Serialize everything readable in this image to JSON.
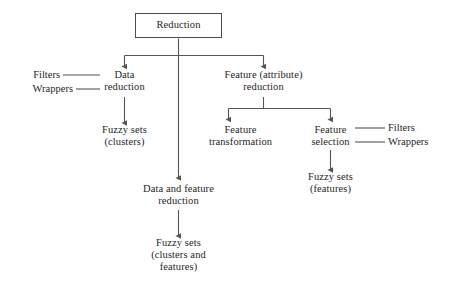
{
  "diagram": {
    "stroke_color": "#555555",
    "text_color": "#262626",
    "background": "#ffffff",
    "nodes": {
      "root": {
        "label": "Reduction"
      },
      "data_reduction": {
        "line1": "Data",
        "line2": "reduction"
      },
      "feature_reduction": {
        "line1": "Feature (attribute)",
        "line2": "reduction"
      },
      "fuzzy_clusters": {
        "line1": "Fuzzy sets",
        "line2": "(clusters)"
      },
      "data_and_feature_reduction": {
        "line1": "Data and feature",
        "line2": "reduction"
      },
      "fuzzy_clusters_features": {
        "line1": "Fuzzy sets",
        "line2": "(clusters and",
        "line3": "features)"
      },
      "feature_transformation": {
        "line1": "Feature",
        "line2": "transformation"
      },
      "feature_selection": {
        "line1": "Feature",
        "line2": "selection"
      },
      "fuzzy_features": {
        "line1": "Fuzzy sets",
        "line2": "(features)"
      }
    },
    "side_labels": {
      "left_filters": "Filters",
      "left_wrappers": "Wrappers",
      "right_filters": "Filters",
      "right_wrappers": "Wrappers"
    }
  }
}
